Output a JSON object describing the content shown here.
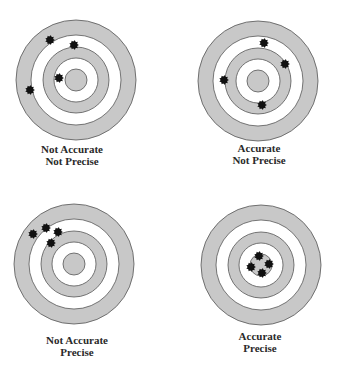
{
  "colors": {
    "ring_fill": "#c8c8c8",
    "ring_stroke": "#555555",
    "background": "#ffffff",
    "shot": "#111111",
    "text": "#2a2a2a"
  },
  "ring_radii": [
    60,
    45,
    33,
    22,
    11
  ],
  "targets": [
    {
      "id": "not-accurate-not-precise",
      "center": [
        76,
        80
      ],
      "label_line1": "Not Accurate",
      "label_line2": "Not Precise",
      "label_pos": [
        7,
        143
      ],
      "shots": [
        [
          50,
          40
        ],
        [
          74,
          45
        ],
        [
          59,
          78
        ],
        [
          30,
          90
        ]
      ]
    },
    {
      "id": "accurate-not-precise",
      "center": [
        258,
        81
      ],
      "label_line1": "Accurate",
      "label_line2": "Not Precise",
      "label_pos": [
        194,
        142
      ],
      "shots": [
        [
          264,
          43
        ],
        [
          285,
          64
        ],
        [
          224,
          80
        ],
        [
          262,
          105
        ]
      ]
    },
    {
      "id": "not-accurate-precise",
      "center": [
        74,
        264
      ],
      "label_line1": "Not Accurate",
      "label_line2": "Precise",
      "label_pos": [
        12,
        334
      ],
      "shots": [
        [
          33,
          234
        ],
        [
          46,
          228
        ],
        [
          58,
          232
        ],
        [
          51,
          243
        ]
      ]
    },
    {
      "id": "accurate-precise",
      "center": [
        261,
        265
      ],
      "label_line1": "Accurate",
      "label_line2": "Precise",
      "label_pos": [
        195,
        330
      ],
      "shots": [
        [
          259,
          256
        ],
        [
          251,
          267
        ],
        [
          269,
          264
        ],
        [
          262,
          273
        ]
      ]
    }
  ]
}
